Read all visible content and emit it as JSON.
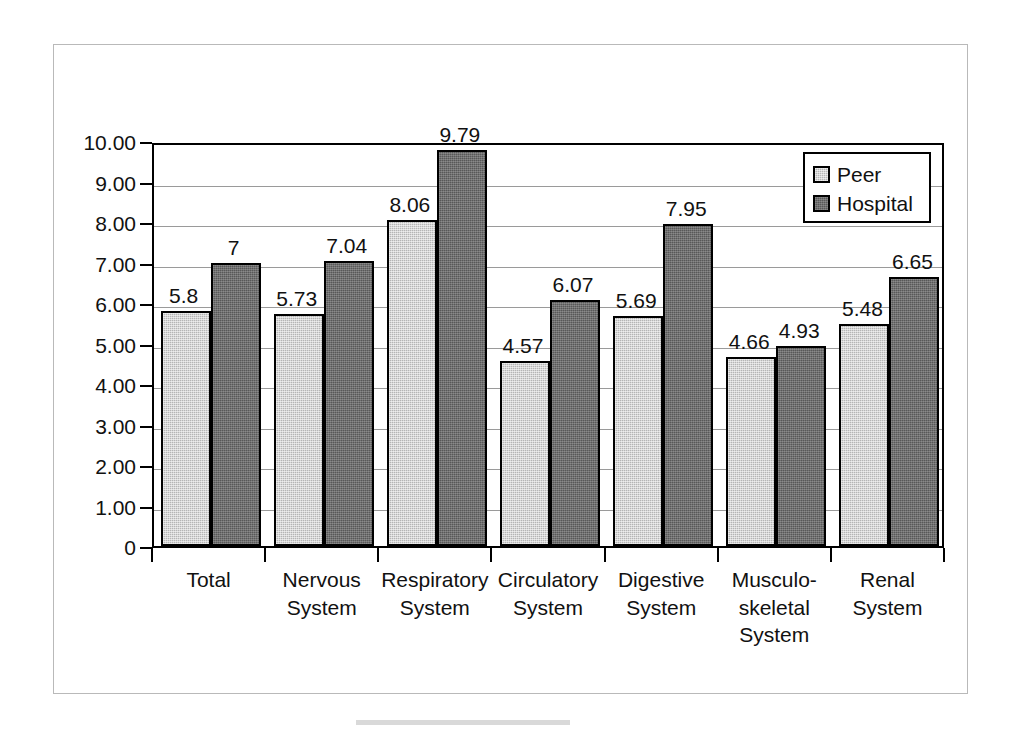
{
  "chart_data": {
    "type": "bar",
    "title": "",
    "subtitle": "",
    "xlabel": "",
    "ylabel": "",
    "ylim": [
      0,
      10
    ],
    "grid": true,
    "legend_position": "top-right",
    "y_ticks": [
      "10.00",
      "9.00",
      "8.00",
      "7.00",
      "6.00",
      "5.00",
      "4.00",
      "3.00",
      "2.00",
      "1.00",
      "0"
    ],
    "y_tick_values": [
      10,
      9,
      8,
      7,
      6,
      5,
      4,
      3,
      2,
      1,
      0
    ],
    "categories": [
      "Total",
      "Nervous\nSystem",
      "Respiratory\nSystem",
      "Circulatory\nSystem",
      "Digestive\nSystem",
      "Musculo-\nskeletal\nSystem",
      "Renal\nSystem"
    ],
    "series": [
      {
        "name": "Peer",
        "color": "#b5b5b5",
        "values": [
          5.8,
          5.73,
          8.06,
          4.57,
          5.69,
          4.66,
          5.48
        ],
        "labels": [
          "5.8",
          "5.73",
          "8.06",
          "4.57",
          "5.69",
          "4.66",
          "5.48"
        ]
      },
      {
        "name": "Hospital",
        "color": "#585858",
        "values": [
          7,
          7.04,
          9.79,
          6.07,
          7.95,
          4.93,
          6.65
        ],
        "labels": [
          "7",
          "7.04",
          "9.79",
          "6.07",
          "7.95",
          "4.93",
          "6.65"
        ]
      }
    ]
  },
  "legend": {
    "items": [
      {
        "label": "Peer",
        "swatch": "peer"
      },
      {
        "label": "Hospital",
        "swatch": "hospital"
      }
    ]
  }
}
